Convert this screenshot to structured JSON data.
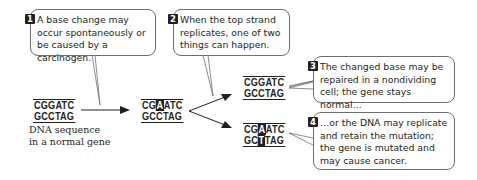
{
  "callouts": [
    {
      "number": "1",
      "text": "A base change may occur spontaneously or be caused by a carcinogen."
    },
    {
      "number": "2",
      "text": "When the top strand replicates, one of two things can happen."
    },
    {
      "number": "3",
      "text": "The changed base may be repaired in a nondividing cell; the gene stays normal…"
    },
    {
      "number": "4",
      "text": "…or the DNA may replicate and retain the mutation; the gene is mutated and may cause cancer."
    }
  ],
  "sequences": {
    "normal": {
      "top": "CGGATC",
      "bottom": "GCCTAG"
    },
    "changed": {
      "top_pre": "CG",
      "top_hl": "A",
      "top_post": "ATC",
      "bottom": "GCCTAG"
    },
    "repaired": {
      "top": "CGGATC",
      "bottom": "GCCTAG"
    },
    "mutated": {
      "top_pre": "CG",
      "top_hl": "A",
      "top_post": "ATC",
      "bottom_pre": "GC",
      "bottom_hl": "T",
      "bottom_post": "TAG"
    }
  },
  "caption": {
    "line1": "DNA sequence",
    "line2": "in a normal gene"
  },
  "colors": {
    "ink": "#231f20",
    "border": "#6d6e71"
  }
}
